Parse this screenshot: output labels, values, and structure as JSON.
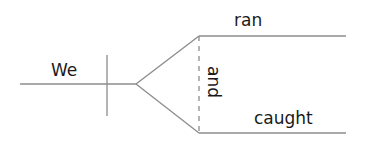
{
  "diagram": {
    "type": "sentence-diagram",
    "subject": "We",
    "conjunction": "and",
    "predicates": [
      "ran",
      "caught"
    ],
    "line_color": "#8c8c8c",
    "text_color": "#1a1a1a"
  }
}
